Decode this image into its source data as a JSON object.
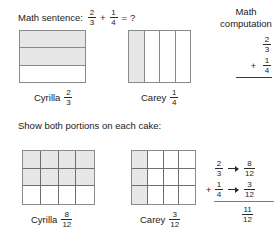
{
  "sentence": {
    "label": "Math sentence:",
    "fraction_a": {
      "num": "2",
      "den": "3"
    },
    "operator": "+",
    "fraction_b": {
      "num": "1",
      "den": "4"
    },
    "equals": "=",
    "question": "?"
  },
  "computation_heading": {
    "line1": "Math",
    "line2": "computation"
  },
  "computation_top": {
    "addend1": {
      "num": "2",
      "den": "3"
    },
    "plus": "+",
    "addend2": {
      "num": "1",
      "den": "4"
    }
  },
  "section_heading": "Show both portions on each cake:",
  "cakes_top": {
    "left": {
      "name": "Cyrilla",
      "fraction": {
        "num": "2",
        "den": "3"
      },
      "divisions": 3,
      "orientation": "horizontal",
      "shaded": [
        true,
        true,
        false
      ]
    },
    "right": {
      "name": "Carey",
      "fraction": {
        "num": "1",
        "den": "4"
      },
      "divisions": 4,
      "orientation": "vertical",
      "shaded": [
        true,
        false,
        false,
        false
      ]
    }
  },
  "cakes_bottom": {
    "left": {
      "name": "Cyrilla",
      "fraction": {
        "num": "8",
        "den": "12"
      },
      "columns": 4,
      "rows": 3,
      "shaded_cells": [
        true,
        true,
        true,
        true,
        true,
        true,
        true,
        true,
        false,
        false,
        false,
        false
      ]
    },
    "right": {
      "name": "Carey",
      "fraction": {
        "num": "3",
        "den": "12"
      },
      "columns": 4,
      "rows": 3,
      "shaded_cells": [
        true,
        false,
        false,
        false,
        true,
        false,
        false,
        false,
        true,
        false,
        false,
        false
      ]
    }
  },
  "computation_bottom": {
    "row1": {
      "from": {
        "num": "2",
        "den": "3"
      },
      "to": {
        "num": "8",
        "den": "12"
      }
    },
    "row2": {
      "plus": "+",
      "from": {
        "num": "1",
        "den": "4"
      },
      "to": {
        "num": "3",
        "den": "12"
      }
    },
    "total": {
      "num": "11",
      "den": "12"
    }
  },
  "colors": {
    "shade": "#e7e7e7",
    "outline": "#8a8a8a",
    "gridline": "#6f6f6f",
    "text": "#1a1a1a"
  }
}
